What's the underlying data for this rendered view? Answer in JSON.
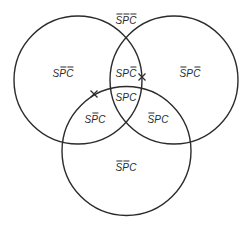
{
  "diagram": {
    "type": "venn",
    "sets": [
      "S",
      "P",
      "C"
    ],
    "colors": {
      "stroke": "#2b2b2b",
      "background": "#ffffff"
    },
    "circles": [
      {
        "name": "S",
        "cx": 78,
        "cy": 80,
        "r": 64
      },
      {
        "name": "P",
        "cx": 174,
        "cy": 80,
        "r": 64
      },
      {
        "name": "C",
        "cx": 126.5,
        "cy": 151,
        "r": 64.5
      }
    ],
    "regions": [
      {
        "id": "outside",
        "text": "SPC",
        "bars": [
          true,
          true,
          true
        ],
        "x": 126,
        "y": 20
      },
      {
        "id": "s-only",
        "text": "SPC",
        "bars": [
          false,
          true,
          true
        ],
        "x": 63,
        "y": 73
      },
      {
        "id": "sp-not-c",
        "text": "SPC",
        "bars": [
          false,
          false,
          true
        ],
        "x": 126,
        "y": 73
      },
      {
        "id": "p-only",
        "text": "SPC",
        "bars": [
          true,
          false,
          true
        ],
        "x": 190,
        "y": 73
      },
      {
        "id": "spc",
        "text": "SPC",
        "bars": [
          false,
          false,
          false
        ],
        "x": 126,
        "y": 97
      },
      {
        "id": "sc-not-p",
        "text": "SPC",
        "bars": [
          false,
          true,
          false
        ],
        "x": 95,
        "y": 119
      },
      {
        "id": "pc-not-s",
        "text": "SPC",
        "bars": [
          true,
          false,
          false
        ],
        "x": 158,
        "y": 119
      },
      {
        "id": "c-only",
        "text": "SPC",
        "bars": [
          true,
          true,
          false
        ],
        "x": 126,
        "y": 167
      }
    ],
    "marks": [
      {
        "symbol": "X",
        "x": 142,
        "y": 77
      },
      {
        "symbol": "X",
        "x": 94,
        "y": 94
      }
    ]
  }
}
